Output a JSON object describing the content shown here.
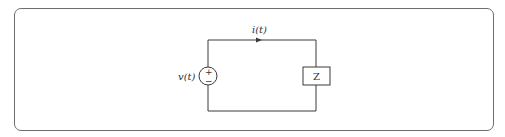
{
  "diagram": {
    "type": "circuit",
    "source": {
      "label": "v(t)",
      "polarity_top": "+",
      "polarity_bottom": "−"
    },
    "current": {
      "label": "i(t)",
      "direction": "clockwise"
    },
    "load": {
      "label": "Z"
    },
    "colors": {
      "wire": "#3a3a3a",
      "frame": "#6e6e6e",
      "text": "#333333"
    }
  }
}
